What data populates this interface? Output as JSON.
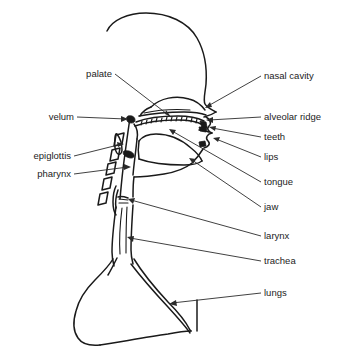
{
  "figure": {
    "background_color": "#ffffff",
    "line_color": "#1a1a1a",
    "label_color": "#1c1c1c"
  },
  "labels": {
    "palate": "palate",
    "velum": "velum",
    "epiglottis": "epiglottis",
    "pharynx": "pharynx",
    "nasal_cavity": "nasal cavity",
    "alveolar_ridge": "alveolar ridge",
    "teeth": "teeth",
    "lips": "lips",
    "tongue": "tongue",
    "jaw": "jaw",
    "larynx": "larynx",
    "trachea": "trachea",
    "lungs": "lungs"
  },
  "left_labels": [
    {
      "key": "palate",
      "text": "palate",
      "x": 112,
      "y": 77
    },
    {
      "key": "velum",
      "text": "velum",
      "x": 74,
      "y": 120
    },
    {
      "key": "epiglottis",
      "text": "epiglottis",
      "x": 71,
      "y": 159
    },
    {
      "key": "pharynx",
      "text": "pharynx",
      "x": 71,
      "y": 177
    }
  ],
  "right_labels": [
    {
      "key": "nasal-cavity",
      "text": "nasal cavity",
      "x": 264,
      "y": 79
    },
    {
      "key": "alveolar-ridge",
      "text": "alveolar ridge",
      "x": 264,
      "y": 120
    },
    {
      "key": "teeth",
      "text": "teeth",
      "x": 264,
      "y": 140
    },
    {
      "key": "lips",
      "text": "lips",
      "x": 264,
      "y": 160
    },
    {
      "key": "tongue",
      "text": "tongue",
      "x": 264,
      "y": 185
    },
    {
      "key": "jaw",
      "text": "jaw",
      "x": 264,
      "y": 210
    },
    {
      "key": "larynx",
      "text": "larynx",
      "x": 264,
      "y": 239
    },
    {
      "key": "trachea",
      "text": "trachea",
      "x": 264,
      "y": 264
    },
    {
      "key": "lungs",
      "text": "lungs",
      "x": 264,
      "y": 296
    }
  ]
}
